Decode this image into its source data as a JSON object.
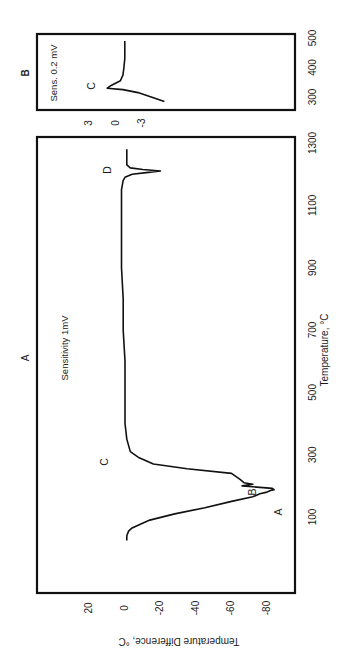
{
  "figure": {
    "orientation": "rotated 90° clockwise (text reads bottom-to-top)",
    "panel_A": {
      "label": "A",
      "sensitivity": "Sensitivity 1mV"
    },
    "panel_B": {
      "label": "B",
      "sensitivity": "Sens. 0.2 mV"
    },
    "xlabel": "Temperature, °C",
    "ylabel": "Temperature Difference, °C"
  },
  "chart_data": [
    {
      "type": "line",
      "panel": "A",
      "title": "A",
      "annotation": "Sensitivity 1mV",
      "xlabel": "Temperature, °C",
      "ylabel": "Temperature Difference, °C",
      "xlim": [
        0,
        1300
      ],
      "ylim": [
        -90,
        30
      ],
      "xticks": [
        100,
        300,
        500,
        700,
        900,
        1100,
        1300
      ],
      "yticks": [
        20,
        0,
        -20,
        -40,
        -60,
        -80
      ],
      "grid": false,
      "peak_labels": [
        {
          "label": "A",
          "x": 197,
          "y": -84
        },
        {
          "label": "B",
          "x": 160,
          "y": -70
        },
        {
          "label": "C",
          "x": 250,
          "y": 10
        },
        {
          "label": "D",
          "x": 1210,
          "y": 8
        }
      ],
      "x": [
        25,
        40,
        55,
        65,
        75,
        90,
        110,
        130,
        150,
        165,
        175,
        180,
        185,
        188,
        192,
        195,
        198,
        200,
        205,
        210,
        220,
        240,
        255,
        270,
        290,
        310,
        350,
        400,
        500,
        600,
        700,
        800,
        900,
        1000,
        1100,
        1150,
        1180,
        1190,
        1200,
        1205,
        1210,
        1215,
        1220,
        1230,
        1250,
        1280
      ],
      "y": [
        -1,
        -1,
        -2,
        -4,
        -8,
        -14,
        -28,
        -45,
        -60,
        -72,
        -76,
        -80,
        -82,
        -84,
        -83,
        -76,
        -70,
        -66,
        -72,
        -67,
        -65,
        -60,
        -35,
        -16,
        -8,
        -3,
        -1,
        0,
        0,
        0,
        1,
        1,
        2,
        2,
        2,
        2,
        1,
        0,
        -4,
        -12,
        -20,
        -10,
        -3,
        -1,
        -1,
        -1
      ]
    },
    {
      "type": "line",
      "panel": "B",
      "title": "B",
      "annotation": "Sens. 0.2 mV",
      "xlabel": "Temperature, °C",
      "xlim": [
        270,
        510
      ],
      "ylim": [
        -5,
        5
      ],
      "xticks": [
        300,
        400,
        500
      ],
      "yticks": [
        3,
        0,
        -3
      ],
      "grid": false,
      "peak_labels": [
        {
          "label": "C",
          "x": 330,
          "y": 1
        }
      ],
      "x": [
        285,
        300,
        315,
        325,
        330,
        340,
        355,
        375,
        400,
        430,
        460,
        490
      ],
      "y": [
        -5.5,
        -4,
        -2.5,
        -0.8,
        1.0,
        0.5,
        -0.5,
        -0.8,
        -0.9,
        -1.0,
        -1.0,
        -1.0
      ]
    }
  ]
}
